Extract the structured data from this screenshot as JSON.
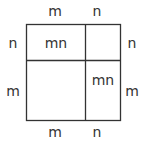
{
  "diagram": {
    "title": "",
    "top_labels": [
      "m",
      "n"
    ],
    "bottom_labels": [
      "m",
      "n"
    ],
    "left_labels": [
      "n",
      "m"
    ],
    "right_labels": [
      "n",
      "m"
    ],
    "cells": {
      "top_left": "mn",
      "top_right": "",
      "bottom_left": "",
      "bottom_right": "mn"
    },
    "stroke_color": "#333333"
  }
}
